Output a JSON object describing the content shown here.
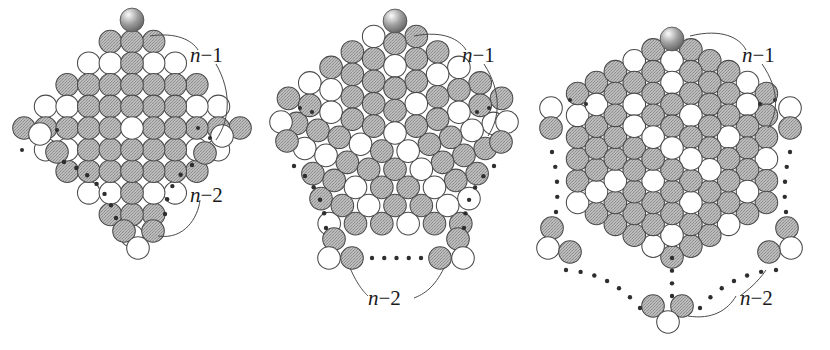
{
  "figure": {
    "title": "Sphere packing shells: square, pentagonal and hexagonal lattices",
    "background_color": "#ffffff",
    "stroke_color": "#4a4a4a",
    "fill_white": "#ffffff",
    "fill_gray": "#b5b5b5",
    "fill_gray_dither": "#a8a8a8",
    "apex_sphere_color": "#8f8f8f",
    "apex_sphere_highlight": "#f2f2f2",
    "label_color": "#1a1a1a"
  },
  "labels": {
    "n_minus_1": "n−1",
    "n_minus_2": "n−2",
    "n": "n",
    "minus": "−",
    "one": "1",
    "two": "2"
  },
  "panels": [
    {
      "id": "square",
      "name": "square-lattice-diamond",
      "shape": "diamond",
      "sides": 4,
      "label_n1": "n−1",
      "label_n2": "n−2",
      "apex_sphere": true,
      "rings_visible": 5,
      "center_x": 132,
      "center_y": 128
    },
    {
      "id": "pentagon",
      "name": "pentagonal-lattice",
      "shape": "pentagon",
      "sides": 5,
      "label_n1": "n−1",
      "label_n2": "n−2",
      "apex_sphere": true,
      "rings_visible": 5,
      "center_x": 395,
      "center_y": 135
    },
    {
      "id": "hexagon",
      "name": "hexagonal-lattice",
      "shape": "hexagon",
      "sides": 6,
      "label_n1": "n−1",
      "label_n2": "n−2",
      "apex_sphere": true,
      "rings_visible": 5,
      "center_x": 672,
      "center_y": 150
    }
  ],
  "chart_data": {
    "type": "diagram",
    "series": [
      {
        "name": "square",
        "sides": 4,
        "shells_drawn": [
          0,
          1,
          2,
          3,
          4,
          5
        ],
        "circles_per_shell": [
          1,
          4,
          8,
          12,
          16,
          20
        ],
        "annotations": [
          "n−1",
          "n−2"
        ]
      },
      {
        "name": "pentagon",
        "sides": 5,
        "shells_drawn": [
          0,
          1,
          2,
          3,
          4,
          5
        ],
        "circles_per_shell": [
          1,
          5,
          10,
          15,
          20,
          25
        ],
        "annotations": [
          "n−1",
          "n−2"
        ]
      },
      {
        "name": "hexagon",
        "sides": 6,
        "shells_drawn": [
          0,
          1,
          2,
          3,
          4,
          5
        ],
        "circles_per_shell": [
          1,
          6,
          12,
          18,
          24,
          30
        ],
        "annotations": [
          "n−1",
          "n−2"
        ]
      }
    ],
    "legend": [],
    "xlabel": "",
    "ylabel": "",
    "grid": false
  }
}
